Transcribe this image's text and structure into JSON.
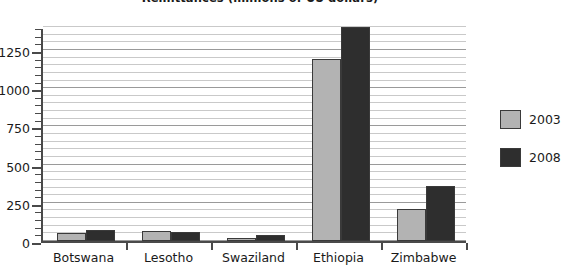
{
  "chart_data": {
    "type": "bar",
    "title": "Remittances (millions of US dollars)",
    "xlabel": "",
    "ylabel": "",
    "categories": [
      "Botswana",
      "Lesotho",
      "Swaziland",
      "Ethiopia",
      "Zimbabwe"
    ],
    "series": [
      {
        "name": "2003",
        "color": "#b3b3b3",
        "values": [
          50,
          65,
          20,
          1190,
          210
        ]
      },
      {
        "name": "2008",
        "color": "#2e2e2e",
        "values": [
          75,
          60,
          40,
          1400,
          360
        ]
      }
    ],
    "ylim": [
      0,
      1400
    ],
    "ytick_labels": [
      "0",
      "250",
      "500",
      "750",
      "1000",
      "1250"
    ],
    "ytick_values": [
      0,
      250,
      500,
      750,
      1000,
      1250
    ],
    "minor_tick_step": 50,
    "grid": true,
    "legend_position": "right"
  },
  "legend": {
    "entries": [
      {
        "label": "2003",
        "color": "#b3b3b3"
      },
      {
        "label": "2008",
        "color": "#2e2e2e"
      }
    ]
  }
}
